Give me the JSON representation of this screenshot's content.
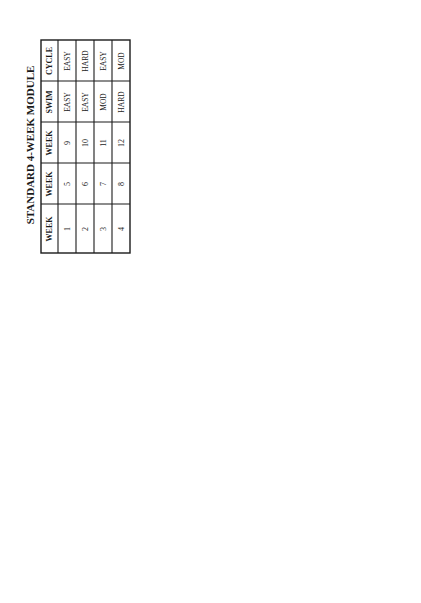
{
  "table": {
    "title": "STANDARD 4-WEEK MODULE",
    "headers": [
      "WEEK",
      "WEEK",
      "WEEK",
      "SWIM",
      "CYCLE",
      "RUN"
    ],
    "rows": [
      [
        "1",
        "5",
        "9",
        "EASY",
        "EASY",
        "EASY"
      ],
      [
        "2",
        "6",
        "10",
        "EASY",
        "HARD",
        "MOD"
      ],
      [
        "3",
        "7",
        "11",
        "MOD",
        "EASY",
        "HARD"
      ],
      [
        "4",
        "8",
        "12",
        "HARD",
        "MOD",
        "EASY"
      ]
    ]
  },
  "start_box": {
    "line1": "BEGINNER",
    "line2": "(Building a Base)"
  },
  "module_label": "MODULE",
  "nodes": [
    "1",
    "2",
    "3",
    "4",
    "5",
    "6",
    "7",
    "8",
    "9",
    "10",
    "11",
    "12"
  ],
  "decision": {
    "label": "DECISION",
    "stay_line1": "STAY AT",
    "stay_line2": "THIS LEVEL",
    "next_label": "GO TO NEXT LEVEL"
  },
  "end_box": {
    "line1": "INTERMEDIATE",
    "line2": "LEVEL"
  }
}
